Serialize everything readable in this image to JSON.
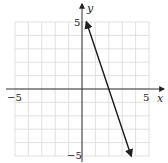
{
  "chart_data": {
    "type": "line",
    "title": "",
    "xlabel": "x",
    "ylabel": "y",
    "xlim": [
      -5,
      5
    ],
    "ylim": [
      -5,
      5
    ],
    "grid": true,
    "tick_labels": {
      "x_min": "−5",
      "x_max": "5",
      "y_min": "−5",
      "y_max": "5"
    },
    "series": [
      {
        "name": "y = -3x + 6",
        "x": [
          0.33,
          3.67
        ],
        "y": [
          5,
          -5
        ],
        "arrows": "both"
      }
    ]
  },
  "colors": {
    "grid": "#d9d9d9",
    "axis": "#333333",
    "line": "#1a1a1a"
  }
}
